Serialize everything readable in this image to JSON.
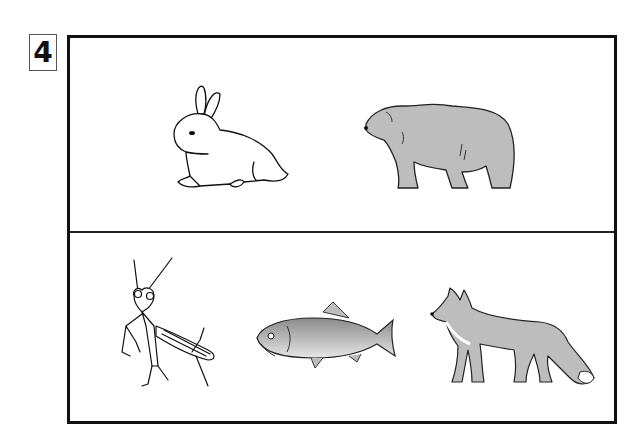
{
  "question": {
    "number": "4"
  },
  "panels": [
    {
      "id": "top",
      "animals": [
        {
          "name": "rabbit",
          "style": "line-art"
        },
        {
          "name": "bear",
          "style": "gray-fill"
        }
      ]
    },
    {
      "id": "bottom",
      "animals": [
        {
          "name": "praying mantis",
          "style": "line-art"
        },
        {
          "name": "carp fish",
          "style": "shaded"
        },
        {
          "name": "fox",
          "style": "gray-fill"
        }
      ]
    }
  ],
  "colors": {
    "frame": "#111111",
    "fill_gray": "#bdbdbd",
    "fish_gray": "#9e9e9e",
    "background": "#ffffff"
  }
}
